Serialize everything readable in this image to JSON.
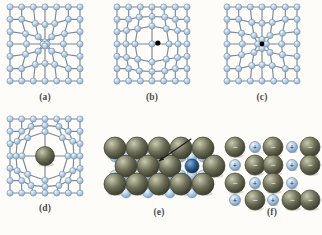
{
  "figure": {
    "background_color": "#fdfcf9",
    "panel_count": 6
  },
  "colors": {
    "host_atom_fill": "#b6cde4",
    "host_atom_fill_light": "#dceaf5",
    "host_atom_stroke": "#6f8fae",
    "bond": "#7b8794",
    "large_atom_fill": "#6e6f58",
    "large_atom_fill_light": "#a8a98e",
    "large_atom_stroke": "#3f402f",
    "small_blue_fill": "#aecbe6",
    "small_blue_light": "#e2eef8",
    "small_blue_stroke": "#6d8cab",
    "impurity_blue_fill": "#2f5f92",
    "impurity_blue_light": "#6d9ecb",
    "impurity_blue_stroke": "#1d3c5e",
    "point_defect": "#000000",
    "arrow": "#1a1a1a",
    "caption_text": "#4a4a4a",
    "charge_sign": "#1b2a3a"
  },
  "panels": [
    {
      "id": "a",
      "caption": "(a)",
      "defect_type": "vacancy",
      "description": "Square lattice of host atoms with one missing atom at the center; surrounding bonds relax inward.",
      "grid_cols": 7,
      "grid_rows": 7,
      "vacancy_site": {
        "col": 3,
        "row": 3
      },
      "marker": "none"
    },
    {
      "id": "b",
      "caption": "(b)",
      "defect_type": "interstitial",
      "description": "Square lattice of host atoms with a small black interstitial particle occupying a void between lattice sites.",
      "grid_cols": 7,
      "grid_rows": 7,
      "vacancy_site": {
        "col": 3,
        "row": 3
      },
      "marker": "black-dot-interstitial",
      "marker_radius": 2.6
    },
    {
      "id": "c",
      "caption": "(c)",
      "defect_type": "substitutional-small",
      "description": "Square lattice with a small black atom substituting a host atom at a lattice site, pulling neighbouring bonds inward.",
      "grid_cols": 7,
      "grid_rows": 7,
      "vacancy_site": {
        "col": 3,
        "row": 3
      },
      "marker": "black-dot-site",
      "marker_radius": 2.4
    },
    {
      "id": "d",
      "caption": "(d)",
      "defect_type": "substitutional-large",
      "description": "Square lattice with a large dark olive impurity atom substituting a host atom, pushing neighbouring bonds outward.",
      "grid_cols": 7,
      "grid_rows": 7,
      "vacancy_site": {
        "col": 3,
        "row": 3
      },
      "marker": "large-sphere",
      "marker_radius": 9.5
    },
    {
      "id": "e",
      "caption": "(e)",
      "defect_type": "impurity-in-close-packed-layer",
      "description": "Close-packed three-dimensional rendering: large olive host spheres with small light blue spheres between them; one dark blue impurity sphere is indicated by an arrow.",
      "large_sphere_radius": 11,
      "small_sphere_radius": 5,
      "impurity_sphere_radius": 7,
      "arrow": {
        "label": "impurity-pointer",
        "from": [
          88,
          5
        ],
        "to": [
          56,
          27
        ]
      }
    },
    {
      "id": "f",
      "caption": "(f)",
      "defect_type": "ionic-schottky-vacancy",
      "description": "Ionic crystal of alternating large negative anions and small positive cations, with a missing ion pair forming a vacancy at the right.",
      "anion_label": "−",
      "cation_label": "+",
      "anion_radius": 10,
      "cation_radius": 5.5
    }
  ],
  "captions": {
    "a": "(a)",
    "b": "(b)",
    "c": "(c)",
    "d": "(d)",
    "e": "(e)",
    "f": "(f)"
  }
}
